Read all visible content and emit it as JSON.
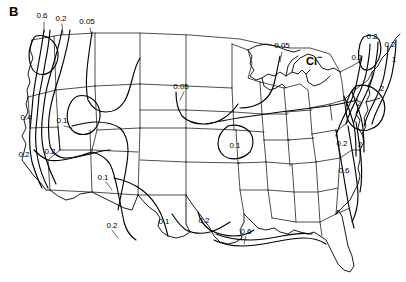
{
  "figure": {
    "panel_label": "B",
    "species_label": "Cl",
    "species_superscript": "−",
    "background_color": "#ffffff",
    "line_color": "#000000",
    "width": 406,
    "height": 282
  },
  "chart_data": {
    "type": "contour-map",
    "title": "B",
    "subject": "Cl−",
    "region": "Contiguous United States",
    "xlabel": "",
    "ylabel": "",
    "grid": false,
    "legend_position": "none",
    "contour_levels": [
      0.05,
      0.1,
      0.2,
      0.4,
      0.6,
      1,
      2
    ],
    "units_implied": "mg/L",
    "contour_labels": [
      {
        "id": "lbl-nw-06",
        "text": "0.6",
        "value": 0.6,
        "x": 42,
        "y": 16,
        "region": "Pacific Northwest coast"
      },
      {
        "id": "lbl-nw-02",
        "text": "0.2",
        "value": 0.2,
        "x": 61,
        "y": 19,
        "region": "Pacific Northwest inland"
      },
      {
        "id": "lbl-nw-005",
        "text": "0.05",
        "value": 0.05,
        "x": 87,
        "y": 22,
        "region": "Northern Rockies"
      },
      {
        "id": "lbl-dakota-005",
        "text": "0.05",
        "value": 0.05,
        "x": 181,
        "y": 87,
        "region": "Northern Plains"
      },
      {
        "id": "lbl-glakes-005",
        "text": "0.05",
        "value": 0.05,
        "x": 282,
        "y": 46,
        "region": "Upper Great Lakes"
      },
      {
        "id": "lbl-ca-04",
        "text": "0.4",
        "value": 0.4,
        "x": 26,
        "y": 118,
        "region": "Northern California coast"
      },
      {
        "id": "lbl-gb-01",
        "text": "0.1",
        "value": 0.1,
        "x": 62,
        "y": 121,
        "region": "Great Basin"
      },
      {
        "id": "lbl-ca-02",
        "text": "0.2",
        "value": 0.2,
        "x": 24,
        "y": 155,
        "region": "Central California"
      },
      {
        "id": "lbl-sw-02",
        "text": "0.2",
        "value": 0.2,
        "x": 50,
        "y": 152,
        "region": "Southern California"
      },
      {
        "id": "lbl-sw-01",
        "text": "0.1",
        "value": 0.1,
        "x": 103,
        "y": 178,
        "region": "Arizona / New Mexico"
      },
      {
        "id": "lbl-sw-02b",
        "text": "0.2",
        "value": 0.2,
        "x": 112,
        "y": 226,
        "region": "Southern New Mexico"
      },
      {
        "id": "lbl-tx-01",
        "text": "0.1",
        "value": 0.1,
        "x": 164,
        "y": 222,
        "region": "West Texas"
      },
      {
        "id": "lbl-tx-02",
        "text": "0.2",
        "value": 0.2,
        "x": 204,
        "y": 221,
        "region": "Central Texas"
      },
      {
        "id": "lbl-mo-01",
        "text": "0.1",
        "value": 0.1,
        "x": 235,
        "y": 146,
        "region": "Missouri / Arkansas"
      },
      {
        "id": "lbl-gulf-06",
        "text": "0.6",
        "value": 0.6,
        "x": 246,
        "y": 232,
        "region": "Gulf Coast"
      },
      {
        "id": "lbl-se-02",
        "text": "0.2",
        "value": 0.2,
        "x": 342,
        "y": 144,
        "region": "Southeast Piedmont"
      },
      {
        "id": "lbl-se-2",
        "text": "2",
        "value": 2,
        "x": 360,
        "y": 145,
        "region": "Southeast coast"
      },
      {
        "id": "lbl-se-06",
        "text": "0.6",
        "value": 0.6,
        "x": 344,
        "y": 171,
        "region": "Carolina coastal plain"
      },
      {
        "id": "lbl-ne-01",
        "text": "0.1",
        "value": 0.1,
        "x": 357,
        "y": 58,
        "region": "New York / Vermont"
      },
      {
        "id": "lbl-ne-02",
        "text": "0.2",
        "value": 0.2,
        "x": 390,
        "y": 45,
        "region": "Northern New England"
      },
      {
        "id": "lbl-ne-1",
        "text": "1",
        "value": 1,
        "x": 394,
        "y": 60,
        "region": "Maine coast"
      },
      {
        "id": "lbl-ne-2",
        "text": "2",
        "value": 2,
        "x": 382,
        "y": 89,
        "region": "New England coast"
      },
      {
        "id": "lbl-ma-02",
        "text": "0.2",
        "value": 0.2,
        "x": 372,
        "y": 37,
        "region": "Upstate New York"
      },
      {
        "id": "lbl-ma-2b",
        "text": "2",
        "value": 2,
        "x": 359,
        "y": 104,
        "region": "Mid-Atlantic coast"
      }
    ]
  }
}
